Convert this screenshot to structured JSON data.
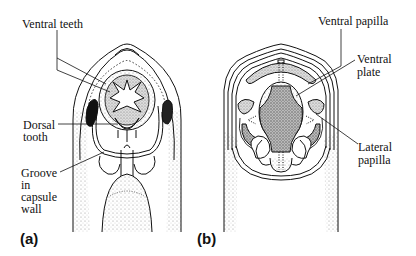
{
  "figure": {
    "panels": [
      {
        "id": "a",
        "label": "(a)",
        "labels": {
          "ventral_teeth": "Ventral teeth",
          "dorsal_tooth_line1": "Dorsal",
          "dorsal_tooth_line2": "tooth",
          "groove_line1": "Groove",
          "groove_line2": "in",
          "groove_line3": "capsule",
          "groove_line4": "wall"
        }
      },
      {
        "id": "b",
        "label": "(b)",
        "labels": {
          "ventral_papilla": "Ventral papilla",
          "ventral_plate_line1": "Ventral",
          "ventral_plate_line2": "plate",
          "lateral_papilla_line1": "Lateral",
          "lateral_papilla_line2": "papilla"
        }
      }
    ]
  }
}
